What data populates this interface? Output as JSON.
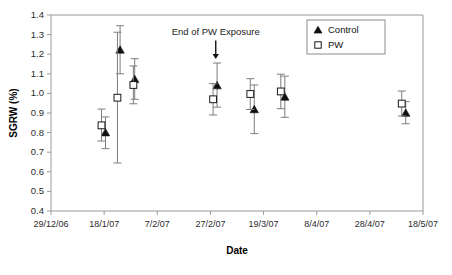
{
  "chart_data": {
    "type": "scatter",
    "title": "",
    "xlabel": "Date",
    "ylabel": "SGRW (%)",
    "ylim": [
      0.4,
      1.4
    ],
    "yticks": [
      "0.4",
      "0.5",
      "0.6",
      "0.7",
      "0.8",
      "0.9",
      "1.0",
      "1.1",
      "1.2",
      "1.3",
      "1.4"
    ],
    "ytick_values": [
      0.4,
      0.5,
      0.6,
      0.7,
      0.8,
      0.9,
      1.0,
      1.1,
      1.2,
      1.3,
      1.4
    ],
    "xticks": [
      "29/12/06",
      "18/1/07",
      "7/2/07",
      "27/2/07",
      "19/3/07",
      "8/4/07",
      "28/4/07",
      "18/5/07"
    ],
    "xtick_positions": [
      0,
      20,
      40,
      60,
      80,
      100,
      120,
      140
    ],
    "xlim": [
      0,
      140
    ],
    "grid": false,
    "legend_position": "top-right",
    "legend": [
      {
        "name": "Control",
        "marker": "filled-triangle",
        "color": "#111111"
      },
      {
        "name": "PW",
        "marker": "open-square",
        "color": "#1a1a1a"
      }
    ],
    "annotations": [
      {
        "text": "End  of PW Exposure",
        "x": 62,
        "y": 1.3,
        "arrow_to_y": 1.175
      }
    ],
    "series": [
      {
        "name": "Control",
        "marker": "filled-triangle",
        "points": [
          {
            "x": 20.5,
            "y": 0.8,
            "err_low": 0.718,
            "err_high": 0.88
          },
          {
            "x": 26.0,
            "y": 1.222,
            "err_low": 1.1,
            "err_high": 1.345
          },
          {
            "x": 31.5,
            "y": 1.072,
            "err_low": 0.97,
            "err_high": 1.177
          },
          {
            "x": 62.5,
            "y": 1.04,
            "err_low": 0.93,
            "err_high": 1.155
          },
          {
            "x": 76.5,
            "y": 0.918,
            "err_low": 0.795,
            "err_high": 1.043
          },
          {
            "x": 88.0,
            "y": 0.982,
            "err_low": 0.878,
            "err_high": 1.088
          },
          {
            "x": 133.5,
            "y": 0.9,
            "err_low": 0.845,
            "err_high": 0.958
          }
        ]
      },
      {
        "name": "PW",
        "marker": "open-square",
        "points": [
          {
            "x": 19.0,
            "y": 0.837,
            "err_low": 0.757,
            "err_high": 0.92
          },
          {
            "x": 25.0,
            "y": 0.978,
            "err_low": 0.645,
            "err_high": 1.312
          },
          {
            "x": 31.0,
            "y": 1.043,
            "err_low": 0.947,
            "err_high": 1.14
          },
          {
            "x": 61.0,
            "y": 0.97,
            "err_low": 0.89,
            "err_high": 1.05
          },
          {
            "x": 75.0,
            "y": 0.997,
            "err_low": 0.918,
            "err_high": 1.075
          },
          {
            "x": 86.5,
            "y": 1.01,
            "err_low": 0.922,
            "err_high": 1.098
          },
          {
            "x": 132.0,
            "y": 0.948,
            "err_low": 0.885,
            "err_high": 1.012
          }
        ]
      }
    ]
  }
}
